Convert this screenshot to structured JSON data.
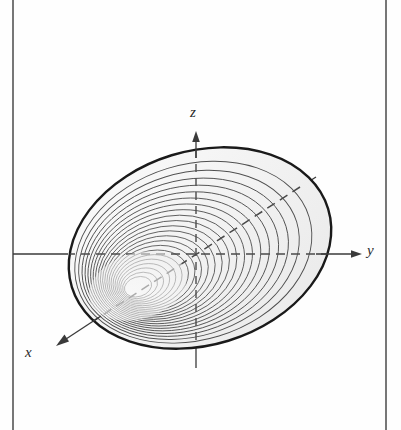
{
  "figure": {
    "kind": "3d-surface-diagram",
    "background_color": "#fefefe",
    "ink_color": "#2a2a2a",
    "outline_color": "#1a1a1a",
    "contour_color": "#4a4a4a",
    "fill_color": "#f4f4f4"
  },
  "frame": {
    "left_rule_x": 13,
    "right_rule_x": 386,
    "rule_color": "#555555",
    "rule_width": 1.6
  },
  "axes": {
    "origin": {
      "x": 196,
      "y": 254
    },
    "items": [
      {
        "name": "z",
        "label": "z",
        "label_x": 193,
        "label_y": 117,
        "solid_from": {
          "x": 196,
          "y": 368
        },
        "solid_to": {
          "x": 196,
          "y": 135
        },
        "arrow": true,
        "arrow_at": {
          "x": 196,
          "y": 135
        },
        "arrow_dir": "up"
      },
      {
        "name": "y",
        "label": "y",
        "label_x": 367,
        "label_y": 255,
        "solid_from": {
          "x": 13,
          "y": 254
        },
        "solid_to": {
          "x": 361,
          "y": 254
        },
        "arrow": true,
        "arrow_at": {
          "x": 361,
          "y": 254
        },
        "arrow_dir": "right"
      },
      {
        "name": "x",
        "label": "x",
        "label_x": 25,
        "label_y": 357,
        "solid_from": {
          "x": 315,
          "y": 178
        },
        "solid_to": {
          "x": 57,
          "y": 345
        },
        "arrow": true,
        "arrow_at": {
          "x": 57,
          "y": 345
        },
        "arrow_dir": "down-left"
      }
    ],
    "hidden_style": "dashed",
    "dash_pattern": "9 6"
  },
  "ellipsoid": {
    "center": {
      "x": 200,
      "y": 248
    },
    "outer_rx": 134,
    "outer_ry": 97,
    "rotation_deg": -17,
    "contour_count": 22,
    "inner_offset": {
      "x": -64,
      "y": 40
    },
    "innermost_rx": 10,
    "innermost_ry": 7
  },
  "chart_data": {
    "type": "scatter",
    "title": "",
    "xlabel": "y",
    "ylabel": "z",
    "zlabel": "x",
    "series": [
      {
        "name": "level surfaces",
        "note": "nested ellipses sharing a common tangency toward the lower-left interior focus"
      }
    ],
    "grid": false,
    "legend": "none"
  }
}
